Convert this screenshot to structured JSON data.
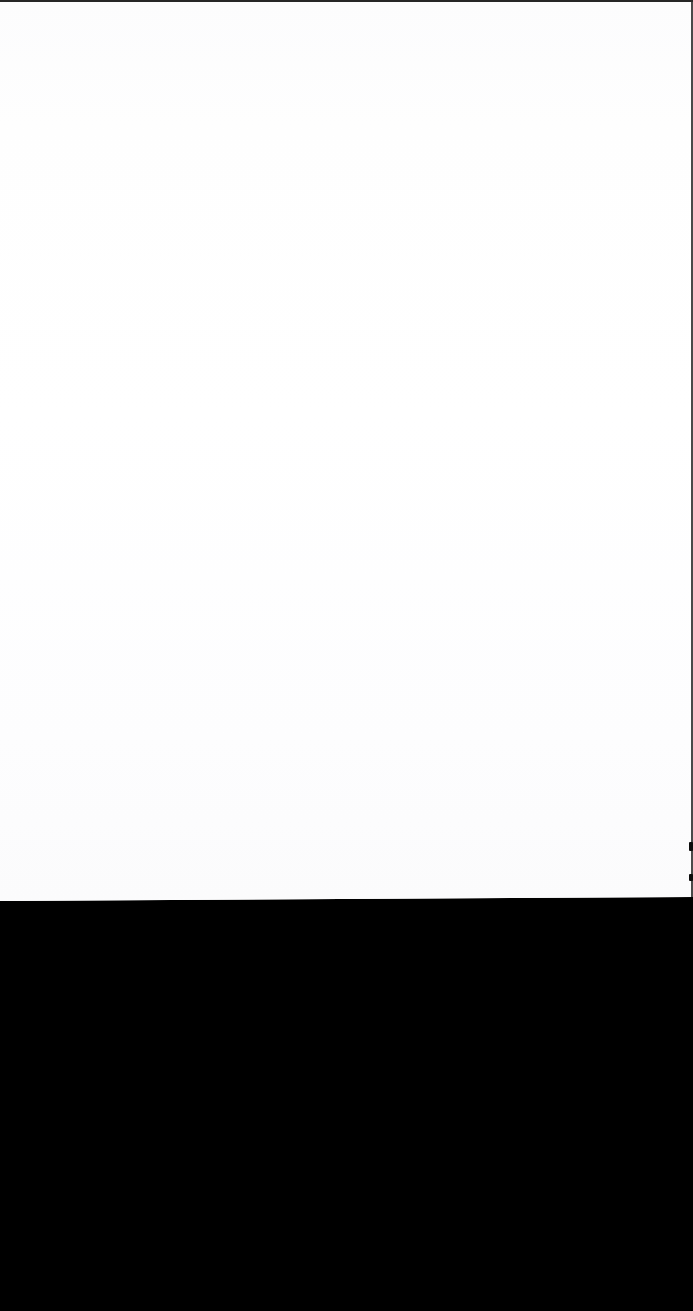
{
  "document": {
    "page_state": "blank",
    "page_text": "",
    "caption": "Blank scanned page"
  },
  "regions": {
    "page_sheet": {
      "name": "white-page-sheet",
      "color": "#fdfdfd",
      "label": ""
    },
    "lower_void": {
      "name": "black-backing-region",
      "color": "#000000",
      "label": ""
    }
  },
  "marks": {
    "top_rule": {
      "name": "top-edge-rule",
      "color": "#141414",
      "label": ""
    },
    "right_rule": {
      "name": "right-edge-rule",
      "color": "#2a2a2a",
      "label": ""
    },
    "ticks": [
      {
        "name": "edge-tick-upper",
        "color": "#0c0c0c",
        "label": ""
      },
      {
        "name": "edge-tick-lower",
        "color": "#0c0c0c",
        "label": ""
      }
    ]
  }
}
